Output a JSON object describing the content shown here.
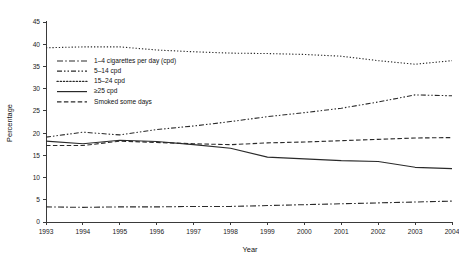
{
  "chart_data": {
    "type": "line",
    "title": "",
    "xlabel": "Year",
    "ylabel": "Percentage",
    "x": [
      1993,
      1994,
      1995,
      1996,
      1997,
      1998,
      1999,
      2000,
      2001,
      2002,
      2003,
      2004
    ],
    "xtick_labels": [
      "1993",
      "1994",
      "1995",
      "1996",
      "1997",
      "1998",
      "1999",
      "2000",
      "2001",
      "2002",
      "2003",
      "2004"
    ],
    "ytick_labels": [
      "0",
      "5",
      "10",
      "15",
      "20",
      "25",
      "30",
      "35",
      "40",
      "45"
    ],
    "yticks": [
      0,
      5,
      10,
      15,
      20,
      25,
      30,
      35,
      40,
      45
    ],
    "xlim": [
      1993,
      2004
    ],
    "ylim": [
      0,
      45
    ],
    "grid": false,
    "legend_position": "upper-left-inside",
    "series": [
      {
        "name": "1–4 cigarettes per day (cpd)",
        "dash": "6,2.2,1.6,2.2",
        "values": [
          3.4,
          3.3,
          3.4,
          3.4,
          3.5,
          3.5,
          3.7,
          3.9,
          4.1,
          4.3,
          4.5,
          4.7
        ]
      },
      {
        "name": "5–14 cpd",
        "dash": "5,2,1.5,2,1.5,2",
        "values": [
          19.1,
          20.2,
          19.6,
          20.8,
          21.6,
          22.6,
          23.7,
          24.6,
          25.6,
          27.0,
          28.6,
          28.4
        ]
      },
      {
        "name": "15–24 cpd",
        "dash": "1.3,1.9",
        "values": [
          39.2,
          39.4,
          39.4,
          38.7,
          38.3,
          38.0,
          37.9,
          37.7,
          37.3,
          36.3,
          35.5,
          36.3
        ]
      },
      {
        "name": "≥25 cpd",
        "dash": "none",
        "values": [
          18.2,
          17.6,
          18.4,
          18.1,
          17.4,
          16.6,
          14.6,
          14.2,
          13.8,
          13.6,
          12.3,
          12.0
        ]
      },
      {
        "name": "Smoked some days",
        "dash": "4.5,2.4",
        "values": [
          17.2,
          17.2,
          18.2,
          17.9,
          17.6,
          17.4,
          17.8,
          18.0,
          18.3,
          18.6,
          18.9,
          19.0
        ]
      }
    ]
  }
}
